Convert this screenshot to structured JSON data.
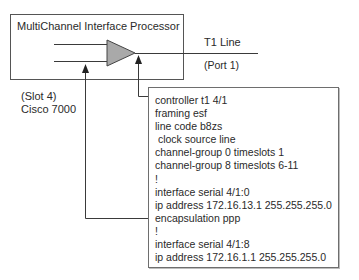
{
  "processor": {
    "title": "MultiChannel Interface Processor",
    "slot_label": "(Slot 4)",
    "router_label": "Cisco 7000"
  },
  "line": {
    "label": "T1 Line",
    "port_label": "(Port 1)"
  },
  "config": {
    "lines": [
      "controller t1 4/1",
      "framing esf",
      "line code b8zs",
      " clock source line",
      "channel-group 0 timeslots 1",
      "channel-group 8 timeslots 6-11",
      "!",
      "interface serial 4/1:0",
      "ip address 172.16.13.1 255.255.255.0",
      "encapsulation ppp",
      "!",
      "interface serial 4/1:8",
      "ip address 172.16.1.1 255.255.255.0"
    ]
  },
  "colors": {
    "line": "#3a3a3a",
    "triangle_fill": "#a9a9a9",
    "box_border": "#6e6e6e"
  }
}
